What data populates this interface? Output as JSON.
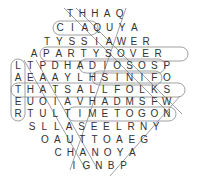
{
  "puzzle": {
    "type": "word-search",
    "rows": [
      {
        "x0": 70,
        "y": 14,
        "letters": "THHAQ"
      },
      {
        "x0": 60,
        "y": 28,
        "letters": "CIAQUYA"
      },
      {
        "x0": 47,
        "y": 42,
        "letters": "TYSSIAWER"
      },
      {
        "x0": 34,
        "y": 54,
        "letters": "APARTYSOVER"
      },
      {
        "x0": 18,
        "y": 66,
        "letters": "LTPDHADIOSOSP"
      },
      {
        "x0": 18,
        "y": 78,
        "letters": "AEAAYLHSINIFO"
      },
      {
        "x0": 18,
        "y": 90,
        "letters": "THATSALLFOLKS"
      },
      {
        "x0": 18,
        "y": 102,
        "letters": "EUOIAVHADMSFW"
      },
      {
        "x0": 18,
        "y": 114,
        "letters": "RTULTIMETOGON"
      },
      {
        "x0": 32,
        "y": 127,
        "letters": "SLLASEELRNY"
      },
      {
        "x0": 45,
        "y": 140,
        "letters": "OAUTTOAEG"
      },
      {
        "x0": 58,
        "y": 153,
        "letters": "CHANOYA"
      },
      {
        "x0": 74,
        "y": 166,
        "letters": "IGNBP"
      }
    ],
    "col_step": 12.4,
    "found_words": [
      "CIAO",
      "PARTYS OVER",
      "ADIOS",
      "THATS ALL FOLKS",
      "TIME TO GO",
      "FINIS",
      "HASTA"
    ],
    "highlight_color": "#888888"
  }
}
